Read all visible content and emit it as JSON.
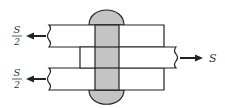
{
  "diagram": {
    "labels": {
      "top_force_numerator": "S",
      "top_force_denominator": "2",
      "bottom_force_numerator": "S",
      "bottom_force_denominator": "2",
      "right_force": "S"
    },
    "colors": {
      "stroke": "#222222",
      "rivet_fill": "#c4c4c4",
      "plate_fill": "#ffffff",
      "text": "#333333"
    }
  }
}
